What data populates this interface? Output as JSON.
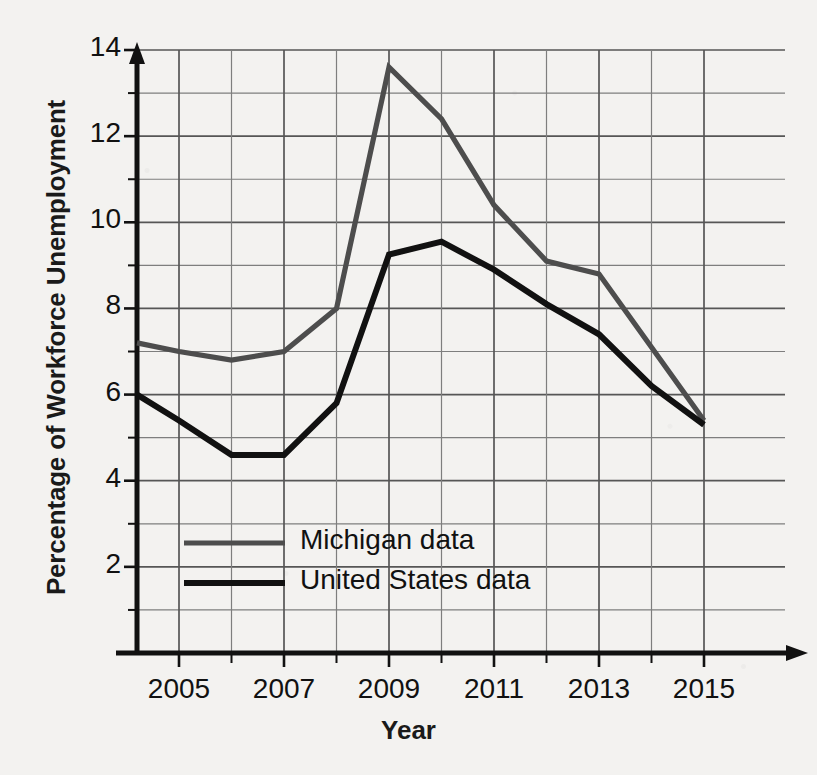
{
  "chart_data": {
    "type": "line",
    "title": "",
    "xlabel": "Year",
    "ylabel": "Percentage of Workforce Unemployment",
    "xlim": [
      2004.2,
      2015.4
    ],
    "ylim": [
      0,
      14
    ],
    "grid": true,
    "x_tick_labels": [
      "2005",
      "2007",
      "2009",
      "2011",
      "2013",
      "2015"
    ],
    "x_tick_values": [
      2005,
      2007,
      2009,
      2011,
      2013,
      2015
    ],
    "x_gridline_values": [
      2005,
      2006,
      2007,
      2008,
      2009,
      2010,
      2011,
      2012,
      2013,
      2014,
      2015
    ],
    "y_tick_labels": [
      "2",
      "4",
      "6",
      "8",
      "10",
      "12",
      "14"
    ],
    "y_tick_values": [
      2,
      4,
      6,
      8,
      10,
      12,
      14
    ],
    "y_gridline_values": [
      1,
      2,
      3,
      4,
      5,
      6,
      7,
      8,
      9,
      10,
      11,
      12,
      13,
      14
    ],
    "legend_position": "inside-lower-left",
    "x": [
      2004.2,
      2005,
      2006,
      2007,
      2008,
      2009,
      2010,
      2011,
      2012,
      2013,
      2014,
      2015
    ],
    "series": [
      {
        "name": "Michigan data",
        "color": "#4d4d4d",
        "values": [
          7.2,
          7.0,
          6.8,
          7.0,
          8.0,
          13.6,
          12.4,
          10.4,
          9.1,
          8.8,
          7.1,
          5.4
        ]
      },
      {
        "name": "United States data",
        "color": "#111111",
        "values": [
          6.0,
          5.4,
          4.6,
          4.6,
          5.8,
          9.25,
          9.55,
          8.9,
          8.1,
          7.4,
          6.2,
          5.3
        ]
      }
    ]
  },
  "legend": {
    "items": [
      {
        "label": "Michigan data",
        "color": "#4d4d4d"
      },
      {
        "label": "United States data",
        "color": "#111111"
      }
    ]
  },
  "axis": {
    "x_title": "Year",
    "y_title": "Percentage of Workforce Unemployment"
  }
}
